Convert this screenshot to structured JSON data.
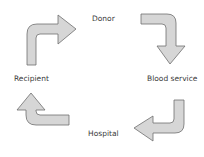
{
  "diagram": {
    "type": "cycle",
    "nodes": [
      {
        "id": "donor",
        "label": "Donor"
      },
      {
        "id": "blood_service",
        "label": "Blood service"
      },
      {
        "id": "hospital",
        "label": "Hospital"
      },
      {
        "id": "recipient",
        "label": "Recipient"
      }
    ],
    "edges": [
      {
        "from": "recipient",
        "to": "donor",
        "icon": "bent-arrow-right-icon"
      },
      {
        "from": "donor",
        "to": "blood_service",
        "icon": "bent-arrow-down-icon"
      },
      {
        "from": "blood_service",
        "to": "hospital",
        "icon": "bent-arrow-left-icon"
      },
      {
        "from": "hospital",
        "to": "recipient",
        "icon": "bent-arrow-up-icon"
      }
    ],
    "colors": {
      "arrow_fill": "#d6d6d6",
      "arrow_stroke": "#6e6e6e",
      "text": "#3a3a3a",
      "background": "#ffffff"
    }
  }
}
